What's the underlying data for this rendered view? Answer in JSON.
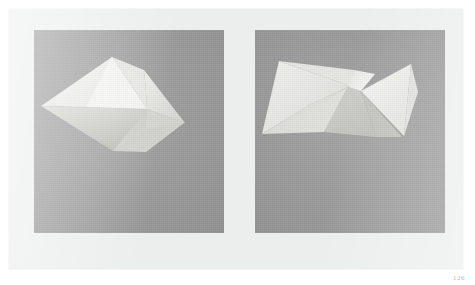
{
  "page": {
    "folio": "126",
    "background_color": "#ffffff",
    "plate_color": "#eceded"
  },
  "plate": {
    "name": "two-figure-photographic-plate",
    "panel_background_color": "#9b9b9b",
    "panels": [
      {
        "id": "panel-left",
        "label": "left-figure",
        "subject": "folded-paper-polyhedron",
        "description": "Angular folded white paper form, pentagon-like silhouette with a bright upper-left facet, a mid-tone right facet and a dim lower shadowed flap, photographed against a flat grey ground.",
        "facets": [
          {
            "name": "upper-bright-facet",
            "color": "#f2f2f0",
            "points": "78,27 110,77 111,77 48,76"
          },
          {
            "name": "main-bright-facet",
            "color": "#eeeeec",
            "points": "78,27 112,78 47,76 7,76"
          },
          {
            "name": "right-upper-facet",
            "color": "#e6e6e3",
            "points": "78,27 110,40 113,62 112,78"
          },
          {
            "name": "right-mid-facet",
            "color": "#dadad6",
            "points": "112,78 113,62 111,40 150,93"
          },
          {
            "name": "right-lower-facet",
            "color": "#d2d2ce",
            "points": "112,78 150,93 111,99"
          },
          {
            "name": "shadow-flap",
            "color": "#bdbdb8",
            "points": "7,76 112,78 110,100 79,120"
          },
          {
            "name": "lower-shadow-facet",
            "color": "#c9c9c4",
            "points": "112,78 149,93 112,121 79,120"
          }
        ]
      },
      {
        "id": "panel-right",
        "label": "right-figure",
        "subject": "folded-paper-polyhedron",
        "description": "The same folded paper form rotated, showing a long shallow wing on the left, a bright saddle ridge in the centre and a tall bright triangular flap at the right, against a flat grey ground.",
        "facets": [
          {
            "name": "left-wing-bright",
            "color": "#ececeA",
            "points": "24,31 93,57 55,74 8,103"
          },
          {
            "name": "left-wing-upper",
            "color": "#e4e4e1",
            "points": "24,31 98,40 93,57"
          },
          {
            "name": "left-wing-lower",
            "color": "#dcdcd8",
            "points": "8,103 55,74 93,57 70,101"
          },
          {
            "name": "centre-ridge-bright",
            "color": "#f1f1ef",
            "points": "93,57 98,40 118,43 104,60"
          },
          {
            "name": "centre-shadow",
            "color": "#c7c7c2",
            "points": "93,57 104,60 118,105 70,101"
          },
          {
            "name": "right-shadow-facet",
            "color": "#c0c0bb",
            "points": "104,60 146,105 118,105"
          },
          {
            "name": "right-bright-flap",
            "color": "#f3f3f1",
            "points": "104,60 154,35 148,104"
          },
          {
            "name": "right-small-facet",
            "color": "#e3e3e0",
            "points": "148,104 154,35 160,60"
          }
        ]
      }
    ]
  }
}
